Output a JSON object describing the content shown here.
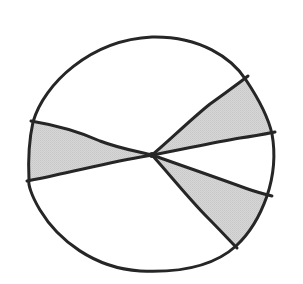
{
  "diagram": {
    "type": "circle-with-shaded-sectors",
    "canvas": {
      "width": 303,
      "height": 284
    },
    "colors": {
      "background": "#ffffff",
      "stroke": "#262626",
      "shade": "#d2d2d2"
    },
    "stroke_width": 3,
    "center": {
      "x": 152,
      "y": 155
    },
    "outline_path": "M 152 37 C 200 36, 232 58, 246 80 C 258 98, 268 116, 272 134 C 276 156, 273 178, 267 196 C 260 216, 249 234, 236 246 C 214 266, 180 273, 140 271 C 94 268, 58 240, 40 210 C 31 195, 28 184, 29 180 C 28 160, 29 140, 33 122 C 44 84, 90 40, 152 37 Z",
    "rays": [
      {
        "name": "ray-left-upper",
        "from": [
          152,
          155
        ],
        "to": [
          31,
          121
        ],
        "path": "M 152 155 C 135 151, 118 148, 100 141 C 80 132, 55 125, 31 121"
      },
      {
        "name": "ray-left-lower",
        "from": [
          152,
          155
        ],
        "to": [
          27,
          181
        ],
        "path": "M 152 155 C 120 160, 90 168, 60 174 C 48 177, 37 179, 27 181"
      },
      {
        "name": "ray-upper-right-1",
        "from": [
          152,
          155
        ],
        "to": [
          248,
          76
        ],
        "path": "M 152 155 C 170 140, 190 120, 210 104 C 225 93, 238 84, 248 76"
      },
      {
        "name": "ray-upper-right-2",
        "from": [
          152,
          155
        ],
        "to": [
          275,
          132
        ],
        "path": "M 152 155 C 180 150, 210 143, 240 138 C 255 136, 265 134, 275 132"
      },
      {
        "name": "ray-lower-right-1",
        "from": [
          152,
          155
        ],
        "to": [
          272,
          196
        ],
        "path": "M 152 155 C 180 165, 215 177, 245 188 C 256 192, 264 194, 272 196"
      },
      {
        "name": "ray-lower-right-2",
        "from": [
          152,
          155
        ],
        "to": [
          237,
          248
        ],
        "path": "M 152 155 C 170 175, 190 200, 208 218 C 220 230, 229 240, 237 248"
      }
    ],
    "sectors": [
      {
        "name": "shaded-sector-left",
        "shaded": true,
        "path": "M 152 155 C 135 151, 118 148, 100 141 C 80 132, 55 125, 33 122 C 29 140, 28 160, 29 180 C 37 179, 48 177, 60 174 C 90 168, 120 160, 152 155 Z"
      },
      {
        "name": "shaded-sector-upper-right",
        "shaded": true,
        "path": "M 152 155 C 170 140, 190 120, 210 104 C 225 93, 238 84, 246 80 C 258 98, 268 116, 272 134 C 265 134, 255 136, 240 138 C 210 143, 180 150, 152 155 Z"
      },
      {
        "name": "shaded-sector-lower-right",
        "shaded": true,
        "path": "M 152 155 C 180 165, 215 177, 245 188 C 256 192, 262 194, 267 196 C 260 216, 249 234, 236 246 C 229 240, 220 230, 208 218 C 190 200, 170 175, 152 155 Z"
      }
    ],
    "labels": []
  }
}
